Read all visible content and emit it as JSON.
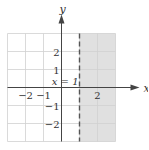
{
  "diagram": {
    "type": "inequality-graph",
    "inequality": "x > 1",
    "boundary": {
      "equation_label": "x = 1",
      "x": 1,
      "style": "dashed"
    },
    "shaded_region": {
      "x_from": 1,
      "x_to": 3,
      "color": "#e0e0e0"
    },
    "x_range": [
      -3,
      3
    ],
    "y_range": [
      -3,
      3
    ],
    "axes": {
      "x_label": "x",
      "y_label": "y"
    },
    "x_ticks": [
      {
        "value": -2,
        "label": "−2"
      },
      {
        "value": -1,
        "label": "−1"
      },
      {
        "value": 2,
        "label": "2"
      }
    ],
    "y_ticks": [
      {
        "value": 2,
        "label": "2"
      },
      {
        "value": 1,
        "label": "1"
      },
      {
        "value": -1,
        "label": "−1"
      },
      {
        "value": -2,
        "label": "−2"
      }
    ],
    "colors": {
      "grid": "#d0d0d0",
      "axis": "#444444",
      "boundary": "#555555"
    }
  }
}
